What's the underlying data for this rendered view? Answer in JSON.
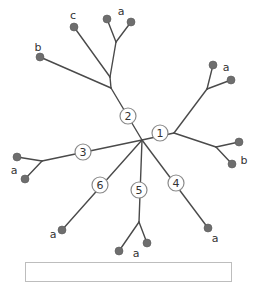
{
  "diagram": {
    "type": "unrooted-tree",
    "colors": {
      "edge": "#4a4a4a",
      "leaf": "#6e6e6e",
      "node_border": "#8a8a8a"
    },
    "hub": {
      "x": 142,
      "y": 140
    },
    "numbered_nodes": [
      {
        "id": "1",
        "label": "1",
        "x": 160,
        "y": 133
      },
      {
        "id": "2",
        "label": "2",
        "x": 128,
        "y": 116
      },
      {
        "id": "3",
        "label": "3",
        "x": 83,
        "y": 152
      },
      {
        "id": "4",
        "label": "4",
        "x": 176,
        "y": 183
      },
      {
        "id": "5",
        "label": "5",
        "x": 139,
        "y": 190
      },
      {
        "id": "6",
        "label": "6",
        "x": 100,
        "y": 185
      }
    ],
    "leaf_labels": [
      {
        "text": "c",
        "x": 73,
        "y": 15
      },
      {
        "text": "a",
        "x": 121,
        "y": 11
      },
      {
        "text": "b",
        "x": 38,
        "y": 47
      },
      {
        "text": "a",
        "x": 226,
        "y": 67
      },
      {
        "text": "b",
        "x": 244,
        "y": 160
      },
      {
        "text": "a",
        "x": 14,
        "y": 170
      },
      {
        "text": "a",
        "x": 53,
        "y": 234
      },
      {
        "text": "a",
        "x": 136,
        "y": 253
      },
      {
        "text": "a",
        "x": 215,
        "y": 238
      }
    ]
  }
}
